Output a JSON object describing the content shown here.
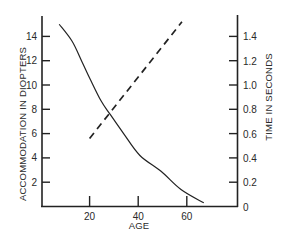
{
  "chart_data": {
    "type": "line",
    "title": "",
    "xlabel": "AGE",
    "ylabel": "ACCOMMODATION IN DIOPTERS",
    "y2label": "TIME IN SECONDS",
    "xlim": [
      0,
      80
    ],
    "ylim": [
      0,
      15.5
    ],
    "y2lim": [
      0,
      1.55
    ],
    "x_ticks": [
      20,
      40,
      60
    ],
    "y_ticks": [
      2,
      4,
      6,
      8,
      10,
      12,
      14
    ],
    "y2_ticks": [
      0,
      0.2,
      0.4,
      0.6,
      0.8,
      1.0,
      1.2,
      1.4
    ],
    "y2_tick_labels": [
      "0",
      "0.2",
      "0.4",
      "0.6",
      "0.8",
      "1.0",
      "1.2",
      "1.4"
    ],
    "grid": false,
    "legend": null,
    "series": [
      {
        "name": "Accommodation",
        "axis": "left",
        "style": "solid",
        "x": [
          7.5,
          12.8,
          16.9,
          20.2,
          24.7,
          28.4,
          34,
          40.7,
          49.4,
          57.6,
          67
        ],
        "y": [
          15.0,
          13.6,
          11.9,
          10.5,
          8.7,
          7.6,
          6.0,
          4.2,
          2.9,
          1.4,
          0.3
        ]
      },
      {
        "name": "Time",
        "axis": "right",
        "style": "dashed",
        "x": [
          20,
          58
        ],
        "y": [
          0.56,
          1.52
        ]
      }
    ]
  }
}
